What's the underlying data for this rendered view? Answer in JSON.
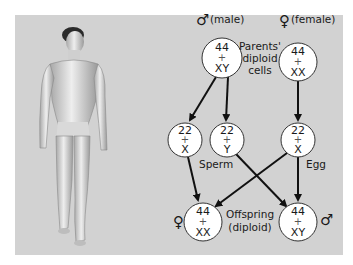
{
  "figure": {
    "background_color": "#d2d2d2"
  },
  "parents": {
    "male": {
      "symbol": "♂",
      "label": "(male)",
      "line1": "44",
      "plus": "+",
      "line2": "XY"
    },
    "female": {
      "symbol": "♀",
      "label": "(female)",
      "line1": "44",
      "plus": "+",
      "line2": "XX"
    },
    "caption_lines": [
      "Parents'",
      "diploid",
      "cells"
    ]
  },
  "gametes": {
    "sperm_x": {
      "line1": "22",
      "plus": "+",
      "line2": "X"
    },
    "sperm_y": {
      "line1": "22",
      "plus": "+",
      "line2": "Y"
    },
    "egg": {
      "line1": "22",
      "plus": "+",
      "line2": "X"
    },
    "sperm_label": "Sperm",
    "egg_label": "Egg"
  },
  "offspring": {
    "female": {
      "symbol": "♀",
      "line1": "44",
      "plus": "+",
      "line2": "XX"
    },
    "male": {
      "symbol": "♂",
      "line1": "44",
      "plus": "+",
      "line2": "XY"
    },
    "caption_lines": [
      "Offspring",
      "(diploid)"
    ]
  }
}
